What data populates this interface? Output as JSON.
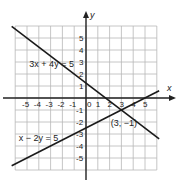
{
  "chart_data": {
    "type": "line",
    "title": "",
    "xlabel": "x",
    "ylabel": "y",
    "xlim": [
      -6,
      6
    ],
    "ylim": [
      -6,
      6
    ],
    "grid": true,
    "x_ticks": [
      "-5",
      "-4",
      "-3",
      "-2",
      "-1",
      "0",
      "1",
      "2",
      "3",
      "4",
      "5"
    ],
    "y_ticks_positive": [
      "5",
      "4",
      "3",
      "2",
      "1"
    ],
    "y_ticks_negative": [
      "-1",
      "-2",
      "-3",
      "-4",
      "-5"
    ],
    "series": [
      {
        "name": "3x + 4y = 5",
        "label": "3x + 4y = 5",
        "equation": {
          "a": 3,
          "b": 4,
          "c": 5
        },
        "x_range": [
          -6.3,
          6.2
        ],
        "label_pos": [
          -4.8,
          2.6
        ]
      },
      {
        "name": "x − 2y = 5",
        "label": "x − 2y = 5",
        "equation": {
          "a": 1,
          "b": -2,
          "c": 5
        },
        "x_range": [
          -6.3,
          6.2
        ],
        "label_pos": [
          -5.7,
          -3.6
        ]
      }
    ],
    "annotations": [
      {
        "text": "(3, −1)",
        "x": 3,
        "y": -1,
        "label_pos": [
          2.1,
          -2.3
        ]
      }
    ]
  }
}
